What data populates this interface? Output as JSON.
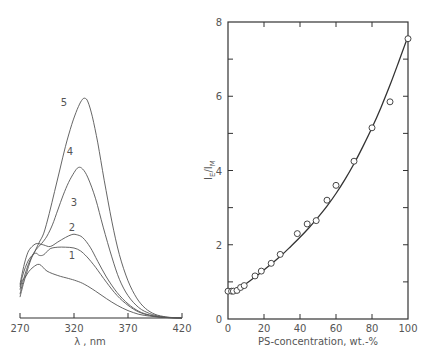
{
  "chart_data": [
    {
      "type": "line",
      "panel": "left",
      "title": "",
      "xlabel": "λ, nm",
      "ylabel": "",
      "xlim": [
        270,
        420
      ],
      "xticks": [
        270,
        320,
        370,
        420
      ],
      "grid": false,
      "legend": "inline curve numbers",
      "series": [
        {
          "name": "1",
          "points": [
            [
              270,
              0.38
            ],
            [
              272,
              0.5
            ],
            [
              275,
              0.55
            ],
            [
              278,
              0.62
            ],
            [
              282,
              0.68
            ],
            [
              288,
              0.72
            ],
            [
              295,
              0.63
            ],
            [
              305,
              0.57
            ],
            [
              315,
              0.53
            ],
            [
              322,
              0.5
            ],
            [
              330,
              0.45
            ],
            [
              340,
              0.36
            ],
            [
              350,
              0.26
            ],
            [
              360,
              0.17
            ],
            [
              370,
              0.1
            ],
            [
              380,
              0.05
            ],
            [
              390,
              0.025
            ],
            [
              400,
              0.01
            ],
            [
              410,
              0.004
            ],
            [
              420,
              0
            ]
          ]
        },
        {
          "name": "2",
          "points": [
            [
              270,
              0.42
            ],
            [
              272,
              0.55
            ],
            [
              275,
              0.68
            ],
            [
              278,
              0.78
            ],
            [
              282,
              0.85
            ],
            [
              285,
              0.87
            ],
            [
              288,
              0.84
            ],
            [
              292,
              0.85
            ],
            [
              298,
              0.93
            ],
            [
              305,
              0.95
            ],
            [
              312,
              0.95
            ],
            [
              320,
              0.94
            ],
            [
              326,
              0.9
            ],
            [
              332,
              0.82
            ],
            [
              340,
              0.68
            ],
            [
              350,
              0.48
            ],
            [
              360,
              0.3
            ],
            [
              370,
              0.17
            ],
            [
              380,
              0.08
            ],
            [
              390,
              0.035
            ],
            [
              400,
              0.012
            ],
            [
              410,
              0.004
            ],
            [
              420,
              0
            ]
          ]
        },
        {
          "name": "3",
          "points": [
            [
              270,
              0.45
            ],
            [
              272,
              0.6
            ],
            [
              275,
              0.78
            ],
            [
              278,
              0.9
            ],
            [
              282,
              0.97
            ],
            [
              286,
              1.0
            ],
            [
              292,
              0.98
            ],
            [
              298,
              0.96
            ],
            [
              305,
              1.02
            ],
            [
              312,
              1.08
            ],
            [
              318,
              1.12
            ],
            [
              322,
              1.12
            ],
            [
              328,
              1.08
            ],
            [
              335,
              0.95
            ],
            [
              342,
              0.76
            ],
            [
              350,
              0.55
            ],
            [
              360,
              0.34
            ],
            [
              370,
              0.19
            ],
            [
              380,
              0.09
            ],
            [
              390,
              0.04
            ],
            [
              400,
              0.014
            ],
            [
              410,
              0.004
            ],
            [
              420,
              0
            ]
          ]
        },
        {
          "name": "4",
          "points": [
            [
              270,
              0.32
            ],
            [
              273,
              0.5
            ],
            [
              276,
              0.65
            ],
            [
              280,
              0.8
            ],
            [
              285,
              0.92
            ],
            [
              290,
              1.0
            ],
            [
              295,
              1.1
            ],
            [
              300,
              1.25
            ],
            [
              305,
              1.45
            ],
            [
              310,
              1.65
            ],
            [
              315,
              1.82
            ],
            [
              320,
              1.95
            ],
            [
              324,
              2.02
            ],
            [
              328,
              2.0
            ],
            [
              333,
              1.88
            ],
            [
              340,
              1.6
            ],
            [
              347,
              1.22
            ],
            [
              355,
              0.82
            ],
            [
              362,
              0.52
            ],
            [
              370,
              0.3
            ],
            [
              380,
              0.14
            ],
            [
              390,
              0.06
            ],
            [
              400,
              0.02
            ],
            [
              410,
              0.006
            ],
            [
              420,
              0
            ]
          ]
        },
        {
          "name": "5",
          "points": [
            [
              270,
              0.28
            ],
            [
              273,
              0.45
            ],
            [
              276,
              0.6
            ],
            [
              280,
              0.78
            ],
            [
              284,
              0.9
            ],
            [
              288,
              1.02
            ],
            [
              292,
              1.14
            ],
            [
              297,
              1.4
            ],
            [
              302,
              1.7
            ],
            [
              307,
              2.0
            ],
            [
              312,
              2.3
            ],
            [
              318,
              2.6
            ],
            [
              323,
              2.8
            ],
            [
              327,
              2.92
            ],
            [
              330,
              2.95
            ],
            [
              333,
              2.9
            ],
            [
              337,
              2.7
            ],
            [
              342,
              2.35
            ],
            [
              348,
              1.85
            ],
            [
              355,
              1.3
            ],
            [
              362,
              0.85
            ],
            [
              370,
              0.5
            ],
            [
              378,
              0.27
            ],
            [
              386,
              0.13
            ],
            [
              395,
              0.05
            ],
            [
              405,
              0.015
            ],
            [
              412,
              0.005
            ],
            [
              420,
              0
            ]
          ]
        }
      ]
    },
    {
      "type": "scatter",
      "panel": "right",
      "title": "",
      "xlabel": "PS-concentration, wt.-%",
      "ylabel": "I_E / I_M",
      "xlim": [
        0,
        100
      ],
      "ylim": [
        0,
        8
      ],
      "xticks": [
        0,
        20,
        40,
        60,
        80,
        100
      ],
      "yticks": [
        0,
        2,
        4,
        6,
        8
      ],
      "grid": false,
      "series": [
        {
          "name": "measured",
          "marker": "open-circle",
          "x": [
            0,
            2,
            3,
            5,
            7,
            9,
            15,
            18.5,
            24,
            29,
            38.5,
            44,
            49,
            55,
            60,
            70,
            80,
            90,
            100
          ],
          "y": [
            0.75,
            0.75,
            0.75,
            0.77,
            0.85,
            0.9,
            1.16,
            1.29,
            1.5,
            1.74,
            2.3,
            2.56,
            2.65,
            3.2,
            3.6,
            4.25,
            5.15,
            5.85,
            7.55
          ]
        },
        {
          "name": "fit",
          "style": "solid-line",
          "x": [
            2,
            5,
            10,
            15,
            20,
            25,
            30,
            35,
            40,
            45,
            50,
            55,
            60,
            65,
            70,
            75,
            80,
            85,
            90,
            95,
            98,
            100
          ],
          "y": [
            0.72,
            0.78,
            0.95,
            1.13,
            1.32,
            1.52,
            1.73,
            1.96,
            2.2,
            2.46,
            2.74,
            3.04,
            3.38,
            3.76,
            4.18,
            4.65,
            5.15,
            5.7,
            6.3,
            6.95,
            7.35,
            7.6
          ]
        }
      ]
    }
  ],
  "left_panel": {
    "x_tick_labels": [
      "270",
      "320",
      "370",
      "420"
    ],
    "x_axis_title": "λ , nm",
    "curve_labels": [
      "1",
      "2",
      "3",
      "4",
      "5"
    ]
  },
  "right_panel": {
    "x_tick_labels": [
      "0",
      "20",
      "40",
      "60",
      "80",
      "100"
    ],
    "y_tick_labels": [
      "0",
      "2",
      "4",
      "6",
      "8"
    ],
    "x_axis_title": "PS-concentration, wt.-%",
    "y_axis_title_main": "I",
    "y_axis_sub_e": "E",
    "y_axis_slash": "/",
    "y_axis_sub_m": "M"
  },
  "colors": {
    "ink": "#555555",
    "axis": "#333333",
    "background": "#ffffff"
  }
}
